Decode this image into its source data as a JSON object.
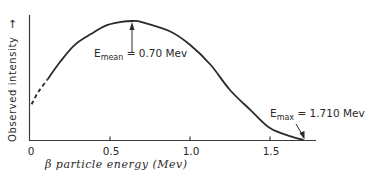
{
  "chart_data": {
    "type": "line",
    "title": "",
    "xlabel": "β particle energy (Mev)",
    "ylabel": "Observed intensity",
    "xlim": [
      0,
      1.8
    ],
    "ylim": [
      0,
      1.0
    ],
    "x_ticks": [
      0,
      0.5,
      1.0,
      1.5
    ],
    "x_tick_labels": [
      "0",
      "0.5",
      "1.0",
      "1.5"
    ],
    "y_ticks": [],
    "grid": false,
    "legend": null,
    "series": [
      {
        "name": "Beta spectrum (measured, solid)",
        "style": "solid",
        "x": [
          0.11,
          0.19,
          0.28,
          0.38,
          0.47,
          0.56,
          0.64,
          0.7,
          0.88,
          1.0,
          1.13,
          1.25,
          1.38,
          1.5,
          1.63,
          1.71
        ],
        "y": [
          0.51,
          0.66,
          0.8,
          0.89,
          0.96,
          0.99,
          1.0,
          0.99,
          0.91,
          0.8,
          0.63,
          0.42,
          0.25,
          0.1,
          0.03,
          0.0
        ]
      },
      {
        "name": "Beta spectrum (extrapolated, dashed)",
        "style": "dashed",
        "x": [
          0.01,
          0.05,
          0.11
        ],
        "y": [
          0.3,
          0.4,
          0.51
        ]
      }
    ],
    "annotations": [
      {
        "text_main": "E",
        "text_sub": "mean",
        "text_value": "= 0.70 Mev",
        "x": 0.64,
        "y": 1.0,
        "arrow": true
      },
      {
        "text_main": "E",
        "text_sub": "max",
        "text_value": "= 1.710 Mev",
        "x": 1.71,
        "y": 0.0,
        "arrow": true
      }
    ]
  },
  "axes": {
    "ylabel": "Observed intensity",
    "ylabel_arrow": "→",
    "xlabel": "β particle energy (Mev)",
    "ticks": [
      "0",
      "0.5",
      "1.0",
      "1.5"
    ]
  },
  "annotations": {
    "mean": {
      "main": "E",
      "sub": "mean",
      "value": " = 0.70 Mev"
    },
    "max": {
      "main": "E",
      "sub": "max",
      "value": " = 1.710 Mev"
    }
  }
}
